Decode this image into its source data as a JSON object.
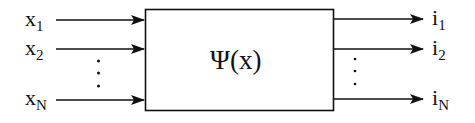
{
  "diagram": {
    "block_label": "Ψ(x)",
    "inputs": [
      {
        "base": "x",
        "sub": "1"
      },
      {
        "base": "x",
        "sub": "2"
      },
      {
        "base": "x",
        "sub": "N"
      }
    ],
    "outputs": [
      {
        "base": "i",
        "sub": "1"
      },
      {
        "base": "i",
        "sub": "2"
      },
      {
        "base": "i",
        "sub": "N"
      }
    ],
    "ellipsis": "⋮"
  }
}
